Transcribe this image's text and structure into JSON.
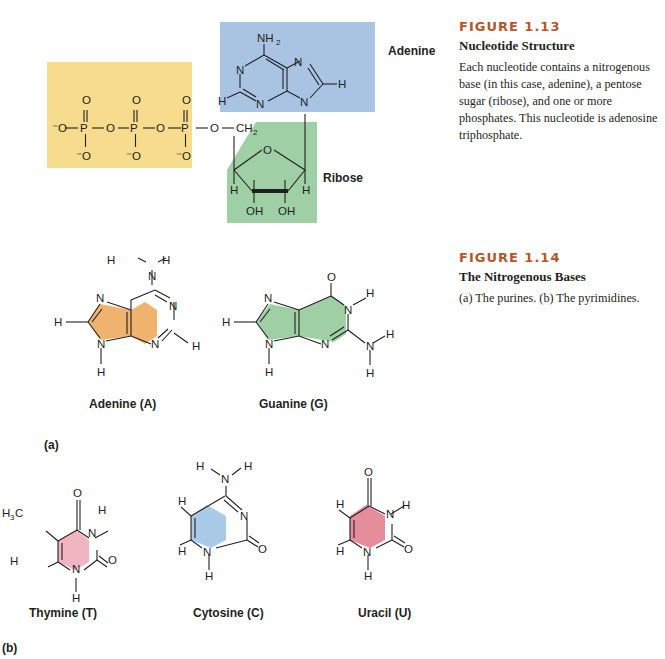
{
  "figure_1_13": {
    "number": "FIGURE 1.13",
    "title": "Nucleotide Structure",
    "body": "Each nucleotide contains a nitrogenous base (in this case, adenine), a pentose sugar (ribose), and one or more phosphates. This nucleotide is adenosine triphosphate.",
    "labels": {
      "base": "Adenine",
      "sugar": "Ribose"
    },
    "colors": {
      "phosphate": "#f6dc8c",
      "base": "#a9c4e2",
      "sugar": "#9fcfa5"
    }
  },
  "figure_1_14": {
    "number": "FIGURE 1.14",
    "title": "The Nitrogenous Bases",
    "body": "(a) The purines. (b) The pyrimidines.",
    "panel_a": "(a)",
    "panel_b": "(b)",
    "purines": [
      {
        "name": "Adenine (A)",
        "color": "#efb36e"
      },
      {
        "name": "Guanine (G)",
        "color": "#9fcfa5"
      }
    ],
    "pyrimidines": [
      {
        "name": "Thymine (T)",
        "color": "#f0b5c1"
      },
      {
        "name": "Cytosine (C)",
        "color": "#a9cbe8"
      },
      {
        "name": "Uracil (U)",
        "color": "#e58d9d"
      }
    ]
  }
}
